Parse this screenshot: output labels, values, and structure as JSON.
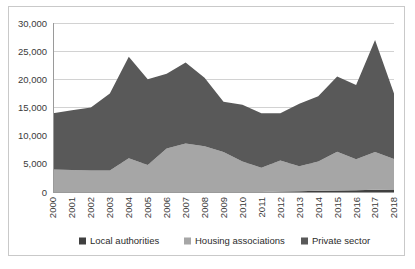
{
  "chart_data": {
    "type": "area",
    "stacked": true,
    "title": "",
    "subtitle": "",
    "xlabel": "",
    "ylabel": "",
    "grid": true,
    "legend_position": "bottom",
    "ylim": [
      0,
      30000
    ],
    "ytick_labels": [
      "0",
      "5,000",
      "10,000",
      "15,000",
      "20,000",
      "25,000",
      "30,000"
    ],
    "ytick_values": [
      0,
      5000,
      10000,
      15000,
      20000,
      25000,
      30000
    ],
    "categories": [
      "2000",
      "2001",
      "2002",
      "2003",
      "2004",
      "2005",
      "2006",
      "2007",
      "2008",
      "2009",
      "2010",
      "2011",
      "2012",
      "2013",
      "2014",
      "2015",
      "2016",
      "2017",
      "2018"
    ],
    "series": [
      {
        "name": "Local authorities",
        "color": "#404040",
        "values": [
          0,
          0,
          0,
          0,
          0,
          0,
          0,
          0,
          0,
          0,
          0,
          0,
          100,
          150,
          200,
          250,
          300,
          400,
          450
        ]
      },
      {
        "name": "Housing associations",
        "color": "#a6a6a6",
        "values": [
          4000,
          3900,
          3800,
          3800,
          6000,
          4800,
          7700,
          8600,
          8100,
          7100,
          5400,
          4300,
          5500,
          4400,
          5200,
          6900,
          5500,
          6700,
          5400
        ]
      },
      {
        "name": "Private sector",
        "color": "#595959",
        "values": [
          10000,
          10600,
          11200,
          13700,
          18000,
          15200,
          13300,
          14400,
          12200,
          8900,
          10100,
          9700,
          8400,
          11100,
          11600,
          13350,
          13200,
          19900,
          11650
        ]
      }
    ],
    "totals": [
      14000,
      14500,
      15000,
      17500,
      24000,
      20000,
      21000,
      23000,
      20300,
      16000,
      15500,
      14000,
      14000,
      15650,
      17000,
      20500,
      19000,
      27000,
      17500
    ]
  },
  "legend": {
    "items": [
      {
        "label": "Local authorities",
        "color": "#404040"
      },
      {
        "label": "Housing associations",
        "color": "#a6a6a6"
      },
      {
        "label": "Private sector",
        "color": "#595959"
      }
    ]
  }
}
